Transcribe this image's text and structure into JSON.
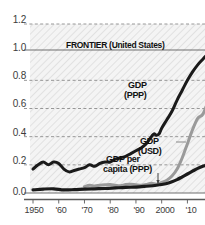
{
  "chart_data": {
    "type": "line",
    "title": "",
    "subtitle": "",
    "xlabel": "",
    "ylabel": "",
    "xlim": [
      1950,
      2018
    ],
    "ylim": [
      0.0,
      1.2
    ],
    "grid": true,
    "grid_style": "dashed horizontal gridlines at 0.2 intervals; solid line at 1.0",
    "legend_position": "inline annotations on curves",
    "y_ticks": [
      "0.0",
      "0.2",
      "0.4",
      "0.6",
      "0.8",
      "1.0",
      "1.2"
    ],
    "y_tick_values": [
      0.0,
      0.2,
      0.4,
      0.6,
      0.8,
      1.0,
      1.2
    ],
    "x_ticks": [
      "1950",
      "'60",
      "'70",
      "'80",
      "'90",
      "2000",
      "'10"
    ],
    "x_tick_values": [
      1950,
      1960,
      1970,
      1980,
      1990,
      2000,
      2010
    ],
    "reference_line": {
      "label": "FRONTIER (United States)",
      "value": 1.0,
      "color": "#6e6e6e"
    },
    "annotations": [
      {
        "name": "gdp-ppp-label",
        "text_line1": "GDP",
        "text_line2": "(PPP)",
        "x": 2003,
        "y": 0.74
      },
      {
        "name": "gdp-usd-label",
        "text_line1": "GDP",
        "text_line2": "(USD)",
        "x": 2001,
        "y": 0.4
      },
      {
        "name": "gdp-per-capita-label",
        "text_line1": "GDP per",
        "text_line2": "capita (PPP)",
        "x": 1994,
        "y": 0.22
      }
    ],
    "series": [
      {
        "name": "GDP (PPP)",
        "color": "#1a1a1a",
        "width": 3,
        "x": [
          1950,
          1952,
          1954,
          1956,
          1958,
          1960,
          1962,
          1964,
          1966,
          1968,
          1970,
          1972,
          1974,
          1976,
          1978,
          1980,
          1982,
          1984,
          1986,
          1988,
          1990,
          1992,
          1994,
          1996,
          1997,
          1998,
          1999,
          2000,
          2002,
          2004,
          2006,
          2008,
          2010,
          2012,
          2014,
          2016,
          2018
        ],
        "values": [
          0.17,
          0.2,
          0.22,
          0.2,
          0.22,
          0.21,
          0.17,
          0.15,
          0.16,
          0.17,
          0.18,
          0.2,
          0.19,
          0.21,
          0.22,
          0.22,
          0.24,
          0.25,
          0.26,
          0.28,
          0.3,
          0.32,
          0.35,
          0.4,
          0.42,
          0.41,
          0.42,
          0.46,
          0.52,
          0.58,
          0.66,
          0.73,
          0.8,
          0.86,
          0.91,
          0.95,
          0.99
        ]
      },
      {
        "name": "GDP (USD)",
        "color": "#9a9a9a",
        "width": 3,
        "x": [
          1970,
          1972,
          1974,
          1976,
          1978,
          1980,
          1982,
          1984,
          1986,
          1988,
          1990,
          1992,
          1994,
          1996,
          1998,
          2000,
          2002,
          2004,
          2006,
          2008,
          2010,
          2012,
          2014,
          2016,
          2018
        ],
        "values": [
          0.045,
          0.055,
          0.05,
          0.055,
          0.058,
          0.06,
          0.055,
          0.052,
          0.06,
          0.062,
          0.058,
          0.055,
          0.06,
          0.07,
          0.062,
          0.075,
          0.09,
          0.12,
          0.17,
          0.25,
          0.35,
          0.45,
          0.53,
          0.56,
          0.65
        ]
      },
      {
        "name": "GDP per capita (PPP)",
        "color": "#1a1a1a",
        "width": 3.2,
        "x": [
          1950,
          1954,
          1958,
          1962,
          1966,
          1970,
          1974,
          1978,
          1982,
          1986,
          1990,
          1994,
          1998,
          2000,
          2002,
          2004,
          2006,
          2008,
          2010,
          2012,
          2014,
          2016,
          2018
        ],
        "values": [
          0.022,
          0.028,
          0.03,
          0.022,
          0.024,
          0.028,
          0.03,
          0.032,
          0.036,
          0.04,
          0.042,
          0.048,
          0.055,
          0.06,
          0.068,
          0.08,
          0.095,
          0.115,
          0.135,
          0.155,
          0.175,
          0.19,
          0.2
        ]
      }
    ]
  },
  "axis": {
    "y_labels": [
      "1.2",
      "1.0",
      "0.8",
      "0.6",
      "0.4",
      "0.2",
      "0.0"
    ],
    "x_labels": [
      "1950",
      "'60",
      "'70",
      "'80",
      "'90",
      "2000",
      "'10"
    ]
  },
  "frontier": {
    "label": "FRONTIER (United States)"
  },
  "labels": {
    "ppp_1": "GDP",
    "ppp_2": "(PPP)",
    "usd_1": "GDP",
    "usd_2": "(USD)",
    "pc_1": "GDP per",
    "pc_2": "capita (PPP)"
  },
  "colors": {
    "ppp": "#1a1a1a",
    "usd": "#9a9a9a",
    "frontier_line": "#6e6e6e",
    "grid": "#8c8c8c",
    "plot_bg": "#f2f2f2",
    "text": "#3b3b3b"
  }
}
